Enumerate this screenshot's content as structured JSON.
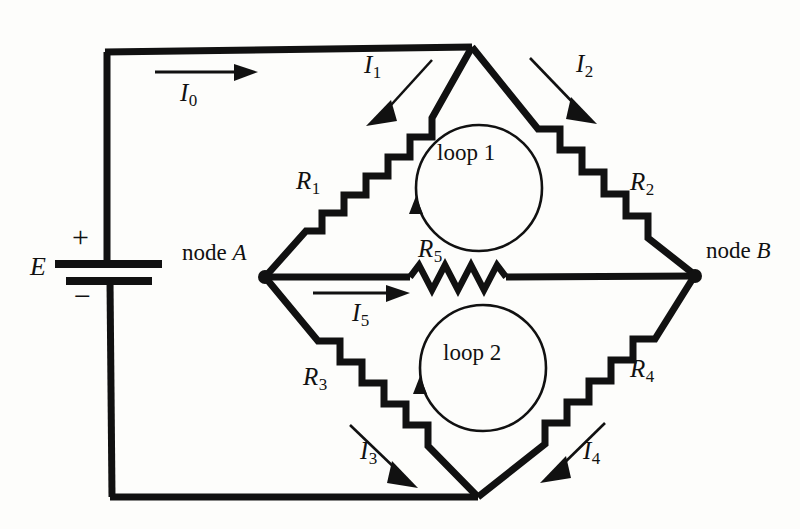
{
  "diagram": {
    "type": "circuit-schematic",
    "background_color": "#fdfdfb",
    "ink_color": "#111111"
  },
  "source": {
    "symbol": "battery",
    "label": "E",
    "plus_sign": "+",
    "minus_sign": "−"
  },
  "nodes": [
    {
      "id": "A",
      "label_prefix": "node",
      "label_letter": "A"
    },
    {
      "id": "B",
      "label_prefix": "node",
      "label_letter": "B"
    }
  ],
  "resistors": [
    {
      "id": "R1",
      "label": "R",
      "sub": "1",
      "style": "staircase"
    },
    {
      "id": "R2",
      "label": "R",
      "sub": "2",
      "style": "staircase"
    },
    {
      "id": "R3",
      "label": "R",
      "sub": "3",
      "style": "staircase"
    },
    {
      "id": "R4",
      "label": "R",
      "sub": "4",
      "style": "staircase"
    },
    {
      "id": "R5",
      "label": "R",
      "sub": "5",
      "style": "zigzag"
    }
  ],
  "currents": [
    {
      "id": "I0",
      "label": "I",
      "sub": "0",
      "direction": "right"
    },
    {
      "id": "I1",
      "label": "I",
      "sub": "1",
      "direction": "down-left"
    },
    {
      "id": "I2",
      "label": "I",
      "sub": "2",
      "direction": "down-right"
    },
    {
      "id": "I3",
      "label": "I",
      "sub": "3",
      "direction": "down-right"
    },
    {
      "id": "I4",
      "label": "I",
      "sub": "4",
      "direction": "down-left"
    },
    {
      "id": "I5",
      "label": "I",
      "sub": "5",
      "direction": "right"
    }
  ],
  "loops": [
    {
      "id": "loop1",
      "label": "loop 1",
      "direction": "counterclockwise"
    },
    {
      "id": "loop2",
      "label": "loop 2",
      "direction": "counterclockwise"
    }
  ]
}
